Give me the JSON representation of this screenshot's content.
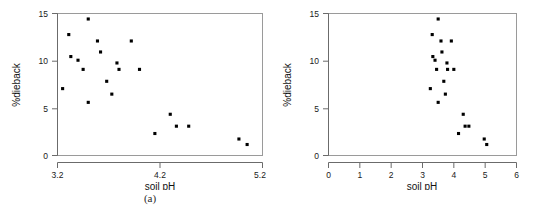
{
  "figure": {
    "panels": [
      {
        "id": "a",
        "caption": "(a)",
        "xlabel": "soil pH",
        "ylabel": "%dieback",
        "xticks": [
          "3.2",
          "4.2",
          "5.2"
        ],
        "yticks": [
          "0",
          "5",
          "10",
          "15"
        ]
      },
      {
        "id": "b",
        "caption": "(b)",
        "xlabel": "soil pH",
        "ylabel": "%dieback",
        "xticks": [
          "0",
          "1",
          "2",
          "3",
          "4",
          "5",
          "6"
        ],
        "yticks": [
          "0",
          "5",
          "10",
          "15"
        ]
      }
    ]
  },
  "chart_data": [
    {
      "type": "scatter",
      "title": "",
      "panel": "(a)",
      "xlabel": "soil pH",
      "ylabel": "%dieback",
      "xlim": [
        3.2,
        5.2
      ],
      "ylim": [
        0,
        15.5
      ],
      "xticks": [
        3.2,
        4.2,
        5.2
      ],
      "yticks": [
        0,
        5,
        10,
        15
      ],
      "grid": false,
      "legend": false,
      "marker": "filled-square",
      "marker_color": "#000000",
      "x": [
        3.25,
        3.31,
        3.33,
        3.4,
        3.45,
        3.5,
        3.5,
        3.59,
        3.62,
        3.68,
        3.73,
        3.78,
        3.8,
        3.92,
        4.0,
        4.15,
        4.3,
        4.36,
        4.48,
        4.97,
        5.05
      ],
      "y": [
        7.3,
        13.2,
        10.8,
        10.4,
        9.4,
        14.9,
        5.8,
        12.5,
        11.3,
        8.1,
        6.7,
        10.1,
        9.4,
        12.5,
        9.4,
        2.4,
        4.5,
        3.2,
        3.2,
        1.8,
        1.2
      ]
    },
    {
      "type": "scatter",
      "title": "",
      "panel": "(b)",
      "xlabel": "soil pH",
      "ylabel": "%dieback",
      "xlim": [
        0,
        6
      ],
      "ylim": [
        0,
        15.5
      ],
      "xticks": [
        0,
        1,
        2,
        3,
        4,
        5,
        6
      ],
      "yticks": [
        0,
        5,
        10,
        15
      ],
      "grid": false,
      "legend": false,
      "marker": "filled-square",
      "marker_color": "#000000",
      "x": [
        3.25,
        3.31,
        3.33,
        3.4,
        3.45,
        3.5,
        3.5,
        3.59,
        3.62,
        3.68,
        3.73,
        3.78,
        3.8,
        3.92,
        4.0,
        4.15,
        4.3,
        4.36,
        4.48,
        4.97,
        5.05
      ],
      "y": [
        7.3,
        13.2,
        10.8,
        10.4,
        9.4,
        14.9,
        5.8,
        12.5,
        11.3,
        8.1,
        6.7,
        10.1,
        9.4,
        12.5,
        9.4,
        2.4,
        4.5,
        3.2,
        3.2,
        1.8,
        1.2
      ]
    }
  ]
}
